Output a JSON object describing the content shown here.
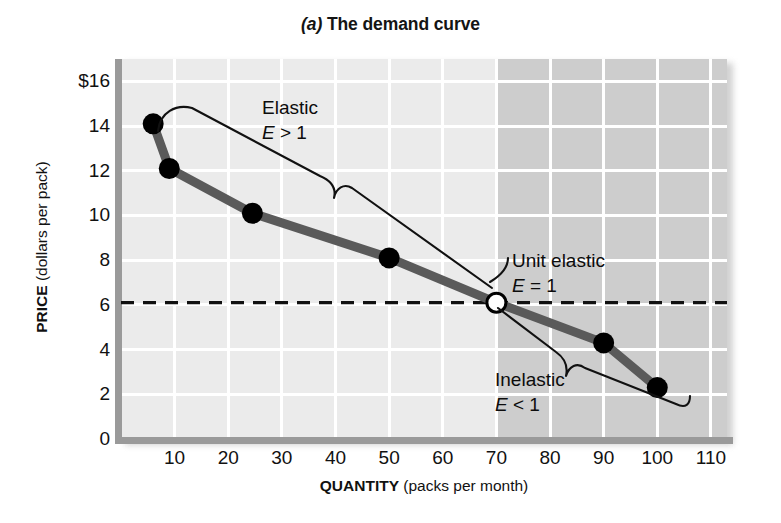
{
  "title": {
    "prefix": "(a)",
    "text": " The demand curve",
    "full": "(a) The demand curve"
  },
  "axes": {
    "y_label_bold": "PRICE",
    "y_label_rest": " (dollars per pack)",
    "x_label_bold": "QUANTITY",
    "x_label_rest": " (packs per month)",
    "y_ticks": [
      "$16",
      "14",
      "12",
      "10",
      "8",
      "6",
      "4",
      "2",
      "0"
    ],
    "x_ticks": [
      "10",
      "20",
      "30",
      "40",
      "50",
      "60",
      "70",
      "80",
      "90",
      "100",
      "110"
    ]
  },
  "annotations": {
    "elastic_title": "Elastic",
    "elastic_formula_var": "E",
    "elastic_formula_rest": " > 1",
    "unit_title": "Unit elastic",
    "unit_formula_var": "E",
    "unit_formula_rest": " = 1",
    "inelastic_title": "Inelastic",
    "inelastic_formula_var": "E",
    "inelastic_formula_rest": " < 1"
  },
  "colors": {
    "plot_background": "#ebebeb",
    "plot_background_shaded": "#cdcdcd",
    "gridline": "#ffffff",
    "axis": "#9a9a9a",
    "curve": "#5a5a5a",
    "marker": "#000000",
    "unit_marker_fill": "#ffffff",
    "dashed_line": "#111111",
    "text": "#111111"
  },
  "chart_data": {
    "type": "line",
    "title": "(a) The demand curve",
    "xlabel": "QUANTITY (packs per month)",
    "ylabel": "PRICE (dollars per pack)",
    "xlim": [
      0,
      113
    ],
    "ylim": [
      0,
      17
    ],
    "xticks": [
      10,
      20,
      30,
      40,
      50,
      60,
      70,
      80,
      90,
      100,
      110
    ],
    "yticks": [
      0,
      2,
      4,
      6,
      8,
      10,
      12,
      14,
      16
    ],
    "grid": true,
    "legend": "none",
    "series": [
      {
        "name": "Demand curve",
        "x": [
          6,
          9,
          24.5,
          50,
          70,
          90,
          100
        ],
        "y": [
          14.1,
          12.1,
          10.1,
          8.1,
          6.1,
          4.3,
          2.3
        ],
        "marker": "filled-circle",
        "special_markers": [
          {
            "index": 4,
            "style": "open-circle",
            "label": "Unit elastic, E = 1"
          }
        ]
      }
    ],
    "reference_lines": [
      {
        "axis": "y",
        "value": 6.1,
        "style": "dashed",
        "label": ""
      }
    ],
    "shaded_region": {
      "x_from": 70,
      "x_to": 113,
      "color": "#cdcdcd"
    },
    "annotations": [
      {
        "text": "Elastic\nE > 1",
        "x_range": [
          6,
          70
        ],
        "note": "brace over elastic segment"
      },
      {
        "text": "Unit elastic\nE = 1",
        "x": 70,
        "y": 6.1
      },
      {
        "text": "Inelastic\nE < 1",
        "x_range": [
          70,
          100
        ],
        "note": "brace under inelastic segment"
      }
    ]
  }
}
